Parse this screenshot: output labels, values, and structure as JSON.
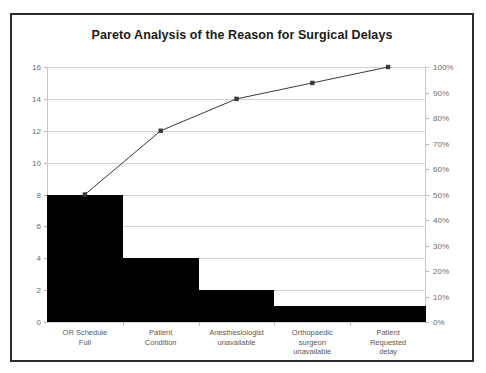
{
  "chart_data": {
    "type": "bar",
    "title": "Pareto Analysis of the Reason for Surgical Delays",
    "xlabel": "",
    "ylabel": "",
    "grid": true,
    "legend": "none",
    "categories": [
      "OR Schedule\nFull",
      "Patient\nCondition",
      "Anesthesiologist\nunavailable",
      "Orthopaedic\nsurgeon\nunavailable",
      "Patient\nRequested\ndelay"
    ],
    "values": [
      8,
      4,
      2,
      1,
      1
    ],
    "ylim": [
      0,
      16
    ],
    "yticks": [
      "0",
      "2",
      "4",
      "6",
      "8",
      "10",
      "12",
      "14",
      "16"
    ],
    "ytick_values": [
      0,
      2,
      4,
      6,
      8,
      10,
      12,
      14,
      16
    ],
    "secondary_axis": {
      "ylim": [
        0,
        100
      ],
      "yticks": [
        "0%",
        "10%",
        "20%",
        "30%",
        "40%",
        "50%",
        "60%",
        "70%",
        "80%",
        "90%",
        "100%"
      ],
      "ytick_values": [
        0,
        10,
        20,
        30,
        40,
        50,
        60,
        70,
        80,
        90,
        100
      ]
    },
    "series": [
      {
        "name": "Count",
        "type": "bar",
        "values": [
          8,
          4,
          2,
          1,
          1
        ],
        "color": "#000000"
      },
      {
        "name": "Cumulative",
        "type": "line",
        "values": [
          8,
          12,
          14,
          15,
          16
        ],
        "percent_values": [
          50,
          75,
          87.5,
          93.75,
          100
        ],
        "color": "#3a3a3a",
        "marker": "square"
      }
    ],
    "total": 16,
    "colors": {
      "bar": "#000000",
      "line": "#3a3a3a",
      "grid": "#d2d2d2",
      "border": "#2b2b2b",
      "tick_text": "#6e6e6e",
      "background": "#ffffff"
    }
  }
}
